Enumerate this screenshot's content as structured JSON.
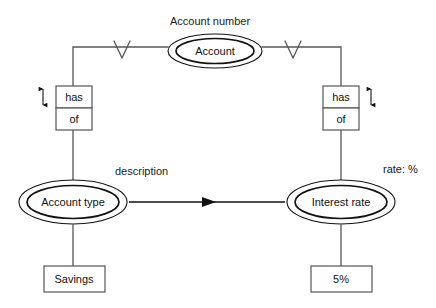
{
  "diagram": {
    "type": "entity-relationship-diagram",
    "background_color": "#ffffff",
    "line_color": "#444444",
    "node_stroke_color": "#111111",
    "text_color": "#1a1a1a"
  },
  "entities": {
    "account": {
      "label": "Account",
      "shape": "double-ellipse",
      "attribute_label": "Account number"
    },
    "account_type": {
      "label": "Account type",
      "shape": "double-ellipse"
    },
    "interest_rate": {
      "label": "Interest rate",
      "shape": "double-ellipse",
      "attribute_label": "rate: %"
    }
  },
  "relationships": {
    "left": {
      "top_label": "has",
      "bottom_label": "of",
      "cardinality_marker": "V"
    },
    "right": {
      "top_label": "has",
      "bottom_label": "of",
      "cardinality_marker": "V"
    },
    "description_arrow": {
      "label": "description",
      "direction": "right"
    }
  },
  "values": {
    "savings": {
      "label": "Savings",
      "shape": "rectangle"
    },
    "rate": {
      "label": "5%",
      "shape": "rectangle"
    }
  }
}
